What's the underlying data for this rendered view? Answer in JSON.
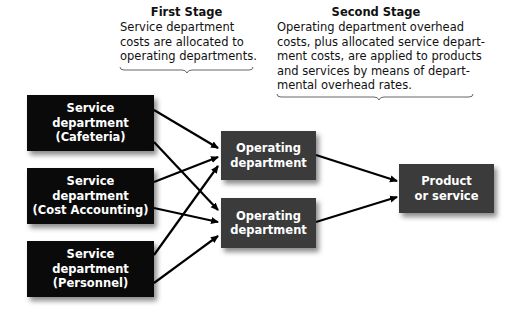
{
  "first_stage": {
    "title": "First Stage",
    "lines": [
      "Service department",
      "costs are allocated to",
      "operating departments."
    ]
  },
  "second_stage": {
    "title": "Second Stage",
    "lines": [
      "Operating department overhead",
      "costs, plus allocated service depart-",
      "ment costs, are applied to products",
      "and services by means of depart-",
      "mental overhead rates."
    ]
  },
  "service_departments": [
    {
      "lines": [
        "Service",
        "department",
        "(Cafeteria)"
      ]
    },
    {
      "lines": [
        "Service",
        "department",
        "(Cost Accounting)"
      ]
    },
    {
      "lines": [
        "Service",
        "department",
        "(Personnel)"
      ]
    }
  ],
  "operating_departments": [
    {
      "lines": [
        "Operating",
        "department"
      ]
    },
    {
      "lines": [
        "Operating",
        "department"
      ]
    }
  ],
  "product": {
    "lines": [
      "Product",
      "or service"
    ]
  },
  "colors": {
    "service_box": "#0a0a0a",
    "operating_box": "#3b3b3b",
    "arrow": "#000000"
  }
}
